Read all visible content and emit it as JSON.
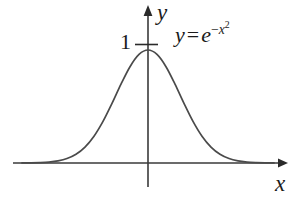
{
  "figure": {
    "name": "gaussian-curve-plot",
    "background_color": "#ffffff",
    "stroke_color": "#4a4a4a",
    "axis_color": "#3a3a3a",
    "text_color": "#1a1a1a"
  },
  "labels": {
    "y_axis": "y",
    "x_axis": "x",
    "tick_one": "1",
    "equation_lhs": "y",
    "equation_equals": "=",
    "equation_base": "e",
    "equation_exponent_minus": "−",
    "equation_exponent_var": "x",
    "equation_exponent_power": "2",
    "equation_full": "y = e^(-x^2)"
  },
  "chart_data": {
    "type": "line",
    "title": "",
    "subtitle": "",
    "xlabel": "x",
    "ylabel": "y",
    "function": "y = e^(-x^2)",
    "legend": [],
    "legend_position": "none",
    "grid": false,
    "annotations": [
      {
        "text": "y = e^(-x^2)",
        "x": 0.75,
        "y": 1.05
      },
      {
        "text": "1",
        "x": -0.28,
        "y": 1.0
      }
    ],
    "axis_style": "arrows-both-ends",
    "ticks": {
      "y": [
        {
          "value": 1,
          "label": "1"
        }
      ],
      "x": []
    },
    "xlim": [
      -2.8,
      2.8
    ],
    "ylim": [
      -0.28,
      1.24
    ],
    "x": [
      -2.8,
      -2.6,
      -2.4,
      -2.2,
      -2.0,
      -1.8,
      -1.6,
      -1.4,
      -1.2,
      -1.0,
      -0.8,
      -0.6,
      -0.4,
      -0.2,
      0.0,
      0.2,
      0.4,
      0.6,
      0.8,
      1.0,
      1.2,
      1.4,
      1.6,
      1.8,
      2.0,
      2.2,
      2.4,
      2.6,
      2.8
    ],
    "y": [
      0.0004,
      0.0012,
      0.0032,
      0.0079,
      0.0183,
      0.0392,
      0.0773,
      0.1409,
      0.2369,
      0.3679,
      0.5273,
      0.6977,
      0.8521,
      0.9608,
      1.0,
      0.9608,
      0.8521,
      0.6977,
      0.5273,
      0.3679,
      0.2369,
      0.1409,
      0.0773,
      0.0392,
      0.0183,
      0.0079,
      0.0032,
      0.0012,
      0.0004
    ]
  }
}
